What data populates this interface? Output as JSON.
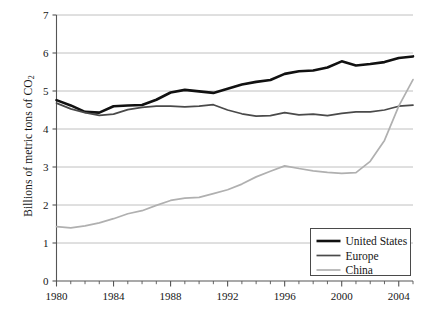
{
  "chart_data": {
    "type": "line",
    "title": "",
    "xlabel": "",
    "ylabel": "Billions of metric tons of CO2",
    "ylabel_display": "Billions of metric tons of CO",
    "ylabel_subscript": "2",
    "xlim": [
      1980,
      2005
    ],
    "ylim": [
      0,
      7
    ],
    "yticks": [
      0,
      1,
      2,
      3,
      4,
      5,
      6,
      7
    ],
    "ytick_labels": [
      "0",
      "1",
      "2",
      "3",
      "4",
      "5",
      "6",
      "7"
    ],
    "xticks": [
      1980,
      1984,
      1988,
      1992,
      1996,
      2000,
      2004
    ],
    "xtick_labels": [
      "1980",
      "1984",
      "1988",
      "1992",
      "1996",
      "2000",
      "2004"
    ],
    "x_minor_tick_interval": 1,
    "grid": "horizontal",
    "grid_color": "#b9b9b9",
    "axis_color": "#555555",
    "legend_position": "bottom-right",
    "x": [
      1980,
      1981,
      1982,
      1983,
      1984,
      1985,
      1986,
      1987,
      1988,
      1989,
      1990,
      1991,
      1992,
      1993,
      1994,
      1995,
      1996,
      1997,
      1998,
      1999,
      2000,
      2001,
      2002,
      2003,
      2004,
      2005
    ],
    "series": [
      {
        "name": "United States",
        "color": "#111111",
        "width": 2.6,
        "values": [
          4.76,
          4.62,
          4.45,
          4.43,
          4.6,
          4.62,
          4.63,
          4.77,
          4.96,
          5.03,
          4.99,
          4.95,
          5.06,
          5.17,
          5.24,
          5.29,
          5.45,
          5.52,
          5.54,
          5.62,
          5.78,
          5.67,
          5.71,
          5.76,
          5.87,
          5.91
        ],
        "last_value": 5.91
      },
      {
        "name": "Europe",
        "color": "#4a4a4a",
        "width": 1.7,
        "values": [
          4.68,
          4.53,
          4.43,
          4.36,
          4.39,
          4.51,
          4.57,
          4.6,
          4.6,
          4.58,
          4.6,
          4.64,
          4.5,
          4.4,
          4.34,
          4.35,
          4.43,
          4.37,
          4.39,
          4.35,
          4.41,
          4.45,
          4.45,
          4.5,
          4.6,
          4.63
        ],
        "last_value": 4.63
      },
      {
        "name": "China",
        "color": "#b0b0b0",
        "width": 1.7,
        "values": [
          1.43,
          1.4,
          1.45,
          1.53,
          1.64,
          1.77,
          1.85,
          1.99,
          2.12,
          2.18,
          2.2,
          2.3,
          2.4,
          2.55,
          2.74,
          2.89,
          3.03,
          2.96,
          2.9,
          2.86,
          2.83,
          2.85,
          3.15,
          3.7,
          4.6,
          5.3
        ],
        "last_value": 5.3
      }
    ],
    "legend": [
      {
        "label": "United States",
        "color": "#111111",
        "width": 2.6
      },
      {
        "label": "Europe",
        "color": "#4a4a4a",
        "width": 1.7
      },
      {
        "label": "China",
        "color": "#b0b0b0",
        "width": 1.7
      }
    ]
  }
}
